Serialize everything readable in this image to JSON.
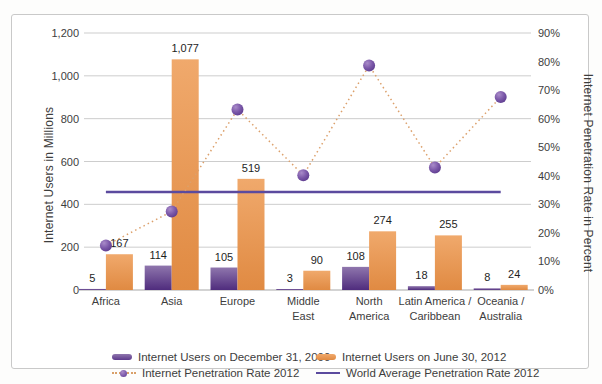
{
  "chart_data": {
    "type": "bar",
    "subtype": "combo-dual-axis-bar-and-line",
    "title": "",
    "categories": [
      "Africa",
      "Asia",
      "Europe",
      "Middle East",
      "North America",
      "Latin America / Caribbean",
      "Oceania / Australia"
    ],
    "category_lines": [
      [
        "Africa"
      ],
      [
        "Asia"
      ],
      [
        "Europe"
      ],
      [
        "Middle",
        "East"
      ],
      [
        "North",
        "America"
      ],
      [
        "Latin America /",
        "Caribbean"
      ],
      [
        "Oceania /",
        "Australia"
      ]
    ],
    "ylabel_left": "Internet Users in Millions",
    "ylabel_right": "Internet Penetration Rate in Percent",
    "ylim_left": [
      0,
      1200
    ],
    "ytick_step_left": 200,
    "left_tick_labels": [
      "0",
      "200",
      "400",
      "600",
      "800",
      "1,000",
      "1,200"
    ],
    "ylim_right": [
      0,
      90
    ],
    "ytick_step_right": 10,
    "right_tick_labels": [
      "0%",
      "10%",
      "20%",
      "30%",
      "40%",
      "50%",
      "60%",
      "70%",
      "80%",
      "90%"
    ],
    "grid": "horizontal",
    "legend_position": "bottom",
    "series": [
      {
        "name": "Internet Users on December 31, 2000",
        "type": "bar",
        "axis": "left",
        "values": [
          5,
          114,
          105,
          3,
          108,
          18,
          8
        ],
        "labels": [
          "5",
          "114",
          "105",
          "3",
          "108",
          "18",
          "8"
        ]
      },
      {
        "name": "Internet Users on June 30, 2012",
        "type": "bar",
        "axis": "left",
        "values": [
          167,
          1077,
          519,
          90,
          274,
          255,
          24
        ],
        "labels": [
          "167",
          "1,077",
          "519",
          "90",
          "274",
          "255",
          "24"
        ]
      },
      {
        "name": "Internet Penetration Rate 2012",
        "type": "line",
        "style": "dotted-with-round-markers",
        "axis": "right",
        "values": [
          15.6,
          27.5,
          63.2,
          40.2,
          78.6,
          42.9,
          67.6
        ]
      },
      {
        "name": "World Average Penetration Rate 2012",
        "type": "line",
        "style": "solid",
        "axis": "right",
        "value": 34.3
      }
    ],
    "colors": {
      "bar_2000_top": "#8f76ad",
      "bar_2000_bottom": "#4f2c7d",
      "bar_2012_top": "#f0a96c",
      "bar_2012_bottom": "#e08a42",
      "penetration_line": "#dca06b",
      "marker_highlight": "#a98bc9",
      "marker_mid": "#7a57a8",
      "marker_edge": "#5b3a8c",
      "world_avg_line": "#5b4a9e",
      "gridline": "#cdcdcd",
      "axis_line": "#a8a8a8",
      "text": "#3d3d3d",
      "value_label_text": "#1e1e1e",
      "frame_border": "#c9c9c9",
      "background": "#ffffff"
    }
  }
}
